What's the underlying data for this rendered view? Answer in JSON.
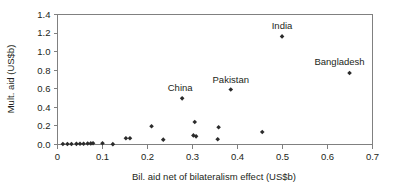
{
  "chart_data": {
    "type": "scatter",
    "title": "",
    "xlabel": "Bil. aid net of bilateralism effect (US$b)",
    "ylabel": "Mult. aid (US$b)",
    "xlim": [
      0,
      0.7
    ],
    "ylim": [
      0,
      1.4
    ],
    "xticks": [
      "0",
      "0.1",
      "0.2",
      "0.3",
      "0.4",
      "0.5",
      "0.6",
      "0.7"
    ],
    "xtick_values": [
      0,
      0.1,
      0.2,
      0.3,
      0.4,
      0.5,
      0.6,
      0.7
    ],
    "yticks": [
      "0.0",
      "0.2",
      "0.4",
      "0.6",
      "0.8",
      "1.0",
      "1.2",
      "1.4"
    ],
    "ytick_values": [
      0.0,
      0.2,
      0.4,
      0.6,
      0.8,
      1.0,
      1.2,
      1.4
    ],
    "grid": false,
    "legend": "none",
    "frame": "full-box",
    "marker_color": "#2b2b2b",
    "axis_color": "#808080",
    "points": [
      {
        "x": 0.012,
        "y": 0.005,
        "label": ""
      },
      {
        "x": 0.022,
        "y": 0.006,
        "label": ""
      },
      {
        "x": 0.031,
        "y": 0.006,
        "label": ""
      },
      {
        "x": 0.042,
        "y": 0.007,
        "label": ""
      },
      {
        "x": 0.05,
        "y": 0.008,
        "label": ""
      },
      {
        "x": 0.058,
        "y": 0.008,
        "label": ""
      },
      {
        "x": 0.067,
        "y": 0.01,
        "label": ""
      },
      {
        "x": 0.074,
        "y": 0.012,
        "label": ""
      },
      {
        "x": 0.079,
        "y": 0.013,
        "label": ""
      },
      {
        "x": 0.1,
        "y": 0.014,
        "label": ""
      },
      {
        "x": 0.123,
        "y": 0.004,
        "label": ""
      },
      {
        "x": 0.152,
        "y": 0.068,
        "label": ""
      },
      {
        "x": 0.161,
        "y": 0.068,
        "label": ""
      },
      {
        "x": 0.209,
        "y": 0.197,
        "label": ""
      },
      {
        "x": 0.235,
        "y": 0.052,
        "label": ""
      },
      {
        "x": 0.277,
        "y": 0.497,
        "label": "China"
      },
      {
        "x": 0.305,
        "y": 0.243,
        "label": ""
      },
      {
        "x": 0.302,
        "y": 0.098,
        "label": ""
      },
      {
        "x": 0.308,
        "y": 0.088,
        "label": ""
      },
      {
        "x": 0.358,
        "y": 0.186,
        "label": ""
      },
      {
        "x": 0.356,
        "y": 0.057,
        "label": ""
      },
      {
        "x": 0.385,
        "y": 0.592,
        "label": "Pakistan"
      },
      {
        "x": 0.455,
        "y": 0.135,
        "label": ""
      },
      {
        "x": 0.499,
        "y": 1.164,
        "label": "India"
      },
      {
        "x": 0.649,
        "y": 0.77,
        "label": "Bangladesh"
      }
    ],
    "annotations": [
      {
        "text": "China",
        "x": 0.277,
        "y": 0.497
      },
      {
        "text": "Pakistan",
        "x": 0.385,
        "y": 0.592
      },
      {
        "text": "India",
        "x": 0.499,
        "y": 1.164
      },
      {
        "text": "Bangladesh",
        "x": 0.649,
        "y": 0.77
      }
    ]
  }
}
